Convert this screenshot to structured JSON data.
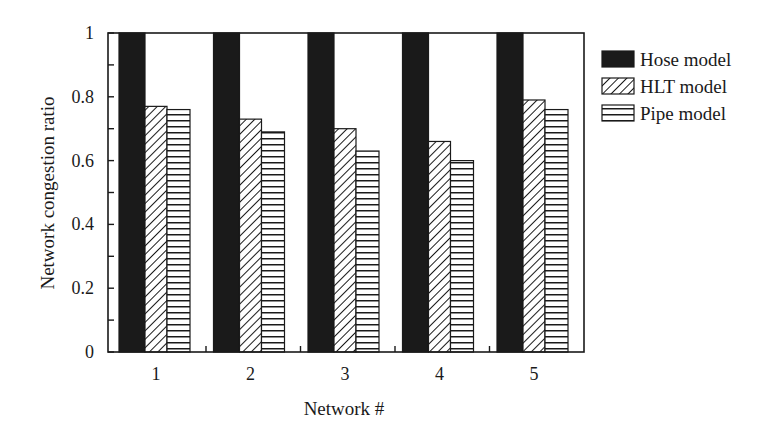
{
  "chart_data": {
    "type": "bar",
    "title": "",
    "xlabel": "Network #",
    "ylabel": "Network congestion ratio",
    "categories": [
      "1",
      "2",
      "3",
      "4",
      "5"
    ],
    "series": [
      {
        "name": "Hose model",
        "pattern": "solid",
        "values": [
          1.0,
          1.0,
          1.0,
          1.0,
          1.0
        ]
      },
      {
        "name": "HLT model",
        "pattern": "diagonal-hatch",
        "values": [
          0.77,
          0.73,
          0.7,
          0.66,
          0.79
        ]
      },
      {
        "name": "Pipe model",
        "pattern": "horizontal-lines",
        "values": [
          0.76,
          0.69,
          0.63,
          0.6,
          0.76
        ]
      }
    ],
    "ylim": [
      0,
      1
    ],
    "yticks": [
      "0",
      "0.2",
      "0.4",
      "0.6",
      "0.8",
      "1"
    ],
    "grid": false,
    "legend_position": "right"
  },
  "colors": {
    "ink": "#1a1a1a",
    "background": "#ffffff"
  }
}
